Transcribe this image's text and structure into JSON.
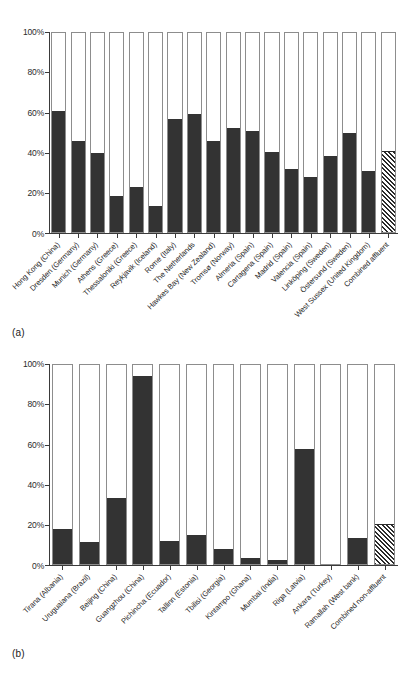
{
  "figure": {
    "panels": [
      {
        "tag": "(a)"
      },
      {
        "tag": "(b)"
      }
    ]
  },
  "chart_data": [
    {
      "type": "bar",
      "panel": "(a)",
      "title": "",
      "xlabel": "",
      "ylabel": "",
      "ylim": [
        0,
        100
      ],
      "yticks": [
        "0%",
        "20%",
        "40%",
        "60%",
        "80%",
        "100%"
      ],
      "ytick_values": [
        0,
        20,
        40,
        60,
        80,
        100
      ],
      "grid": false,
      "legend": "none",
      "stacked": true,
      "bar_style": "filled dark bar on white 100% outline column; last bar hatched",
      "categories": [
        "Hong Kong (China)",
        "Dresden (Germany)",
        "Munich (Germany)",
        "Athens (Greece)",
        "Thessaloniki (Greece)",
        "Reykjavik (Iceland)",
        "Rome (Italy)",
        "The Netherlands",
        "Hawkes Bay (New Zealand)",
        "Tromsø (Norway)",
        "Almeria (Spain)",
        "Cartagena (Spain)",
        "Madrid (Spain)",
        "Valencia (Spain)",
        "Linköping (Sweden)",
        "Östersund (Sweden)",
        "West Sussex (United Kingdom)",
        "Combined affluent"
      ],
      "values": [
        60.0,
        45.5,
        39.5,
        18.0,
        22.5,
        13.0,
        56.0,
        58.5,
        45.5,
        51.5,
        50.5,
        40.0,
        31.5,
        27.5,
        38.0,
        49.5,
        30.5,
        40.5
      ],
      "hatched_index": 17
    },
    {
      "type": "bar",
      "panel": "(b)",
      "title": "",
      "xlabel": "",
      "ylabel": "",
      "ylim": [
        0,
        100
      ],
      "yticks": [
        "0%",
        "20%",
        "40%",
        "60%",
        "80%",
        "100%"
      ],
      "ytick_values": [
        0,
        20,
        40,
        60,
        80,
        100
      ],
      "grid": false,
      "legend": "none",
      "stacked": true,
      "bar_style": "filled dark bar on white 100% outline column; last bar hatched",
      "categories": [
        "Tirana (Albania)",
        "Uruguaiana (Brazil)",
        "Beijing (China)",
        "Guangzhou (China)",
        "Pichincha (Ecuador)",
        "Tallinn (Estonia)",
        "Tbilisi (Georgia)",
        "Kintampo (Ghana)",
        "Mumbai (India)",
        "Riga (Latvia)",
        "Ankara (Turkey)",
        "Ramallah (West bank)",
        "Combined non-affluent"
      ],
      "values": [
        17.5,
        11.0,
        33.0,
        93.5,
        11.5,
        14.5,
        7.5,
        3.0,
        2.0,
        57.0,
        0.0,
        13.0,
        20.0
      ],
      "hatched_index": 12
    }
  ]
}
